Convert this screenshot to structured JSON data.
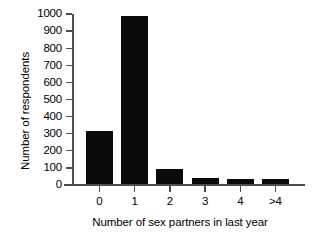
{
  "chart_data": {
    "type": "bar",
    "title": "",
    "xlabel": "Number of sex partners in last year",
    "ylabel": "Number of respondents",
    "categories": [
      "0",
      "1",
      "2",
      "3",
      "4",
      ">4"
    ],
    "values": [
      310,
      985,
      90,
      35,
      30,
      32
    ],
    "series": [
      {
        "name": "Number of respondents",
        "values": [
          310,
          985,
          90,
          35,
          30,
          32
        ]
      }
    ],
    "ylim": [
      0,
      1000
    ],
    "ytick_labels": [
      "0",
      "100",
      "200",
      "300",
      "400",
      "500",
      "600",
      "700",
      "800",
      "900",
      "1000"
    ],
    "ytick_values": [
      0,
      100,
      200,
      300,
      400,
      500,
      600,
      700,
      800,
      900,
      1000
    ],
    "grid": false,
    "legend": null,
    "bar_color": "#0a0a0a",
    "axis_color": "#4d4d4d",
    "background_color": "#ffffff"
  }
}
